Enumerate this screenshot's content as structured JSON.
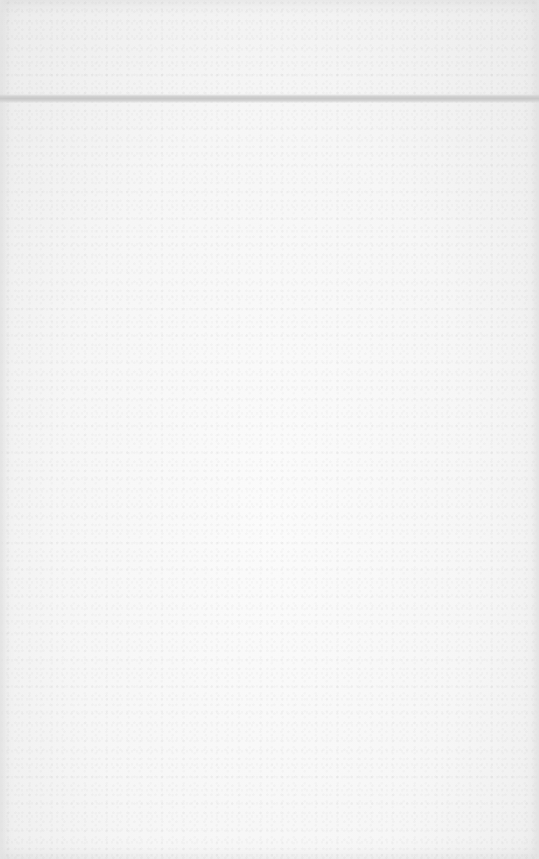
{
  "document": {
    "type": "blank scanned page",
    "header_rule": {
      "visible": true,
      "color": "#c8c8c8"
    },
    "paper_color": "#f6f6f6",
    "body_text": ""
  }
}
